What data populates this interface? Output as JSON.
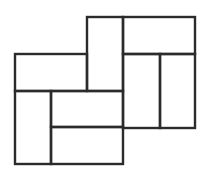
{
  "diagram": {
    "title": "",
    "stroke_color": "#2b2b2b",
    "background": "#ffffff",
    "stroke_width": 2.4,
    "rects": [
      {
        "id": "top-left-vertical",
        "x": 87,
        "y": 17,
        "w": 36,
        "h": 74
      },
      {
        "id": "top-right-horizontal",
        "x": 123,
        "y": 17,
        "w": 72,
        "h": 37
      },
      {
        "id": "right-left-vertical",
        "x": 123,
        "y": 54,
        "w": 37,
        "h": 74
      },
      {
        "id": "right-right-vertical",
        "x": 160,
        "y": 54,
        "w": 35,
        "h": 74
      },
      {
        "id": "left-top-horizontal",
        "x": 15,
        "y": 54,
        "w": 72,
        "h": 37
      },
      {
        "id": "left-bottom-vertical",
        "x": 15,
        "y": 91,
        "w": 36,
        "h": 73
      },
      {
        "id": "center-horizontal",
        "x": 51,
        "y": 91,
        "w": 72,
        "h": 36
      },
      {
        "id": "bottom-horizontal",
        "x": 51,
        "y": 127,
        "w": 72,
        "h": 37
      }
    ]
  }
}
